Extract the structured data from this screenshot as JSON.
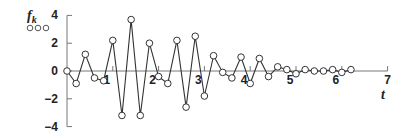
{
  "chart_data": {
    "type": "line",
    "title": "",
    "ylabel": "f_k",
    "ylabel_main": "f",
    "ylabel_sub": "k",
    "xlabel": "t",
    "legend_marker": "ooo",
    "xlim": [
      0,
      7
    ],
    "ylim": [
      -4,
      4
    ],
    "x_ticks": [
      1,
      2,
      3,
      4,
      5,
      6,
      7
    ],
    "y_ticks": [
      4,
      2,
      0,
      -2,
      -4
    ],
    "x_tick_labels": [
      "1",
      "2",
      "3",
      "4",
      "5",
      "6",
      "7"
    ],
    "y_tick_labels": [
      "4",
      "2",
      "0",
      "−2",
      "−4"
    ],
    "grid": false,
    "markers": "open-circle",
    "series": [
      {
        "name": "f_k",
        "x": [
          0,
          0.2,
          0.4,
          0.6,
          0.8,
          1.0,
          1.2,
          1.4,
          1.6,
          1.8,
          2.0,
          2.2,
          2.4,
          2.6,
          2.8,
          3.0,
          3.2,
          3.4,
          3.6,
          3.8,
          4.0,
          4.2,
          4.4,
          4.6,
          4.8,
          5.0,
          5.2,
          5.4,
          5.6,
          5.8,
          6.0,
          6.2
        ],
        "values": [
          0,
          -0.9,
          1.2,
          -0.5,
          -0.7,
          2.2,
          -3.2,
          3.7,
          -3.2,
          2.0,
          -0.4,
          -0.9,
          2.2,
          -2.6,
          2.5,
          -1.8,
          1.1,
          -0.1,
          -0.5,
          1.0,
          -0.9,
          0.9,
          -0.4,
          0.3,
          0.1,
          -0.2,
          0.1,
          0,
          0,
          0.1,
          -0.1,
          0.1
        ]
      }
    ]
  },
  "colors": {
    "line": "#333333",
    "axis": "#777777",
    "marker_fill": "#ffffff"
  }
}
